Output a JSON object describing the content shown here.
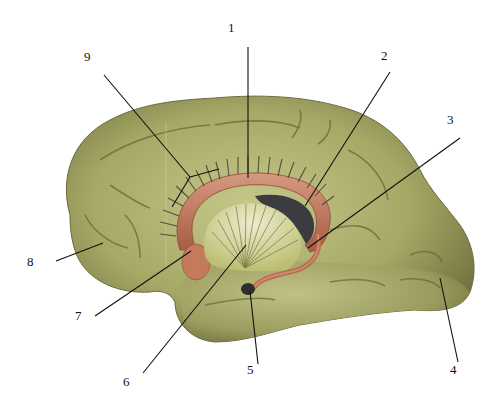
{
  "figure": {
    "type": "anatomical-illustration",
    "colors": {
      "cortex": "#a8ab6a",
      "cortex_dark": "#6f7040",
      "fornix": "#b5674e",
      "fornix_light": "#d79a80",
      "thalamic_region": "#d7d79a",
      "ventricle": "#3c3c40",
      "leader": "#111111"
    },
    "labels": [
      {
        "id": "1",
        "text": "1"
      },
      {
        "id": "2",
        "text": "2"
      },
      {
        "id": "3",
        "text": "3"
      },
      {
        "id": "4",
        "text": "4"
      },
      {
        "id": "5",
        "text": "5"
      },
      {
        "id": "6",
        "text": "6"
      },
      {
        "id": "7",
        "text": "7"
      },
      {
        "id": "8",
        "text": "8"
      },
      {
        "id": "9",
        "text": "9"
      }
    ]
  }
}
